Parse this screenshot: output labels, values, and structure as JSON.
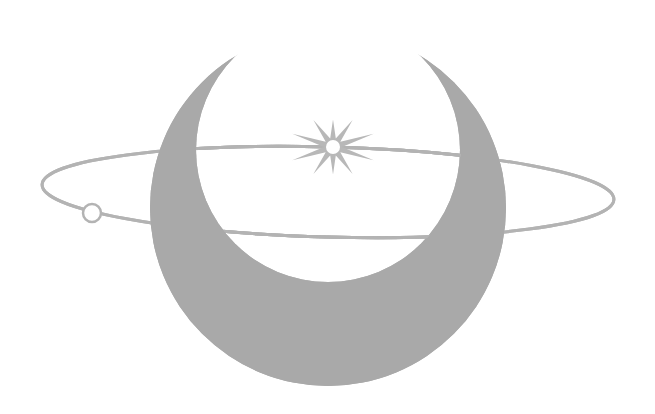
{
  "canvas": {
    "width": 655,
    "height": 414,
    "background": "#ffffff"
  },
  "logo": {
    "description": "crescent moon with orbit ring and sparkle star",
    "colors": {
      "crescent": "#a9a9a9",
      "ring": "#b3b3b3",
      "star": "#b8b8b8",
      "star_core": "#ffffff"
    },
    "crescent": {
      "outer": {
        "cx": 328,
        "cy": 208,
        "r": 178
      },
      "inner": {
        "cx": 328,
        "cy": 150,
        "r": 132
      }
    },
    "ring": {
      "cx": 328,
      "cy": 192,
      "rx": 286,
      "ry": 45,
      "rotation": 1.5,
      "stroke_width": 3
    },
    "ring_bead": {
      "cx": 92,
      "cy": 213,
      "r": 9,
      "stroke_width": 2.5
    },
    "star": {
      "cx": 333,
      "cy": 147,
      "points": 10,
      "outer_r": 38,
      "inner_r": 9,
      "core_r": 7
    }
  }
}
